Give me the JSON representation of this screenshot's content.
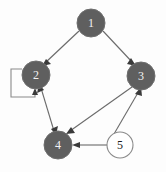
{
  "figure": {
    "kind": "directed-graph",
    "background_color": "#fdfdfd",
    "node_fill_dark": "#5f5f5f",
    "node_fill_light": "#ffffff",
    "node_stroke": "#6e6e6e",
    "node_label_dark": "#1c1c1c",
    "node_label_light": "#f2f2f2",
    "edge_color": "#6b6b6b",
    "arrow_color": "#3a3a3a"
  },
  "nodes": [
    {
      "id": "1",
      "label": "1",
      "cx": 91,
      "cy": 23,
      "r": 14,
      "filled": true
    },
    {
      "id": "2",
      "label": "2",
      "cx": 36,
      "cy": 75,
      "r": 14,
      "filled": true
    },
    {
      "id": "3",
      "label": "3",
      "cx": 141,
      "cy": 76,
      "r": 14,
      "filled": true
    },
    {
      "id": "4",
      "label": "4",
      "cx": 58,
      "cy": 145,
      "r": 14,
      "filled": true
    },
    {
      "id": "5",
      "label": "5",
      "cx": 120,
      "cy": 145,
      "r": 13,
      "filled": false
    }
  ],
  "edges": [
    {
      "from": "1",
      "to": "2",
      "directed": true,
      "bidirectional": false
    },
    {
      "from": "1",
      "to": "3",
      "directed": true,
      "bidirectional": false
    },
    {
      "from": "2",
      "to": "4",
      "directed": true,
      "bidirectional": true
    },
    {
      "from": "3",
      "to": "4",
      "directed": true,
      "bidirectional": false
    },
    {
      "from": "5",
      "to": "4",
      "directed": true,
      "bidirectional": false
    },
    {
      "from": "5",
      "to": "3",
      "directed": true,
      "bidirectional": false
    },
    {
      "from": "2",
      "to": "2",
      "directed": true,
      "bidirectional": false,
      "self_loop": true
    }
  ]
}
